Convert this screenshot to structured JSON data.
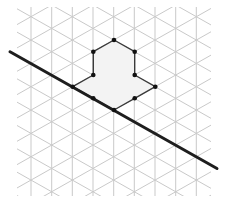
{
  "diagram": {
    "type": "isometric-grid-reflection",
    "colors": {
      "background": "#ffffff",
      "grid": "#c9c9c9",
      "shape_fill": "#f3f3f3",
      "shape_stroke": "#3a3a3a",
      "vertex": "#111111",
      "mirror_line": "#1e1e1e"
    },
    "grid": {
      "clip": {
        "x": 17,
        "y": 7,
        "width": 194,
        "height": 189
      },
      "column_x": [
        10.3,
        31,
        51.7,
        72.3,
        93,
        113.7,
        134.3,
        155,
        175.7,
        196.3,
        217
      ],
      "origin": {
        "x": 31,
        "y": 16.7
      },
      "col_spacing": 20.67,
      "half_row": 11.67
    },
    "shape": {
      "name": "polygon",
      "vertices": [
        [
          114,
          40
        ],
        [
          134.7,
          51.7
        ],
        [
          134.7,
          75
        ],
        [
          155.3,
          86.7
        ],
        [
          134.7,
          98.3
        ],
        [
          114,
          110
        ],
        [
          93.3,
          98.3
        ],
        [
          72.7,
          86.7
        ],
        [
          93.3,
          75
        ],
        [
          93.3,
          51.7
        ]
      ]
    },
    "mirror_line": {
      "name": "line-of-reflection",
      "x1": 10,
      "y1": 51.7,
      "x2": 217,
      "y2": 168.5,
      "width": 3
    }
  }
}
